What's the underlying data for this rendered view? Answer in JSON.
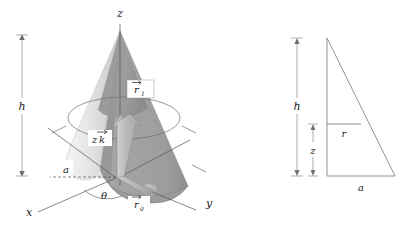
{
  "figure": {
    "background_color": "#ffffff",
    "left_panel": {
      "name": "cone-3d-diagram",
      "axes": {
        "z_label": "z",
        "x_label": "x",
        "y_label": "y"
      },
      "labels": {
        "height_dimension": "h",
        "radius_dashed": "a",
        "angle": "θ",
        "z_vector": "zk",
        "z_vector_base": "z",
        "z_vector_hat": "k",
        "r0_vector_base": "r",
        "r0_vector_sub": "0",
        "r1_vector_base": "r",
        "r1_vector_sub": "1"
      },
      "colors": {
        "cone_left_light": "#e8e8e8",
        "cone_left_mid": "#d2d2d2",
        "cone_dark_face": "#9a9a9a",
        "cone_right_face": "#a8a8a8",
        "cone_inner_shadow": "#8d8d8d",
        "outline": "#6e6e6e",
        "vector_fill": "#b9b9b9",
        "text": "#1a1a1a"
      }
    },
    "right_panel": {
      "name": "cross-section-triangle",
      "labels": {
        "height": "h",
        "sub_height": "z",
        "inner_radius": "r",
        "base_radius": "a"
      },
      "colors": {
        "outline": "#777777",
        "dimension": "#8a8a8a",
        "text": "#1a1a1a"
      }
    }
  }
}
